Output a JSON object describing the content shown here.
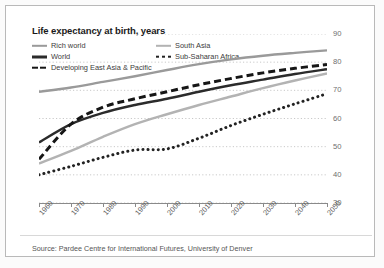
{
  "chart_data": {
    "type": "line",
    "title": "Life expectancy at birth, years",
    "xlabel": "",
    "ylabel": "",
    "source": "Source: Pardee Centre for International Futures, University of Denver",
    "grid": true,
    "grid_style": "dotted-horizontal",
    "legend_position": "top",
    "xlim": [
      1960,
      2050
    ],
    "ylim": [
      30,
      90
    ],
    "x": [
      1960,
      1970,
      1980,
      1990,
      2000,
      2010,
      2020,
      2030,
      2040,
      2050
    ],
    "xticklabels": [
      "1960",
      "1970",
      "1980",
      "1990",
      "2000",
      "2010",
      "2020",
      "2030",
      "2040",
      "2050"
    ],
    "yticks": [
      30,
      40,
      50,
      60,
      70,
      80,
      90
    ],
    "yticklabels": [
      "30",
      "40",
      "50",
      "60",
      "70",
      "80",
      "90"
    ],
    "series": [
      {
        "name": "Rich world",
        "style": "solid",
        "color": "#9a9a9a",
        "width": 2.4,
        "values": [
          69.5,
          71.0,
          73.0,
          75.0,
          77.2,
          79.3,
          81.0,
          82.3,
          83.3,
          84.2
        ]
      },
      {
        "name": "World",
        "style": "solid",
        "color": "#2b2b2b",
        "width": 2.4,
        "values": [
          51.5,
          58.0,
          62.0,
          64.8,
          67.0,
          69.5,
          71.8,
          73.8,
          75.8,
          77.5
        ]
      },
      {
        "name": "Developing East Asia & Pacific",
        "style": "dashed",
        "color": "#161616",
        "width": 3.0,
        "values": [
          45.5,
          58.0,
          64.0,
          67.0,
          69.5,
          72.0,
          74.2,
          76.2,
          77.8,
          79.2
        ]
      },
      {
        "name": "South Asia",
        "style": "solid",
        "color": "#b3b3b3",
        "width": 2.4,
        "values": [
          44.0,
          48.5,
          53.5,
          58.0,
          61.5,
          64.8,
          67.8,
          70.8,
          73.5,
          76.0
        ]
      },
      {
        "name": "Sub-Saharan Africa",
        "style": "dotted",
        "color": "#222222",
        "width": 3.0,
        "values": [
          40.0,
          43.0,
          46.2,
          48.8,
          49.2,
          53.0,
          57.5,
          61.5,
          65.2,
          68.8
        ]
      }
    ]
  },
  "legend": {
    "items": [
      {
        "label": "Rich world",
        "icon": "legend-line-solid"
      },
      {
        "label": "World",
        "icon": "legend-line-solid"
      },
      {
        "label": "Developing East Asia & Pacific",
        "icon": "legend-line-dashed"
      },
      {
        "label": "South Asia",
        "icon": "legend-line-solid"
      },
      {
        "label": "Sub-Saharan Africa",
        "icon": "legend-line-dotted"
      }
    ]
  },
  "colors": {
    "rich_world": "#9a9a9a",
    "world": "#2b2b2b",
    "developing_east_asia_pacific": "#161616",
    "south_asia": "#b3b3b3",
    "sub_saharan_africa": "#222222",
    "grid": "#c9c9c9",
    "axis": "#8a8a8a",
    "frame": "#b9b9b9"
  }
}
